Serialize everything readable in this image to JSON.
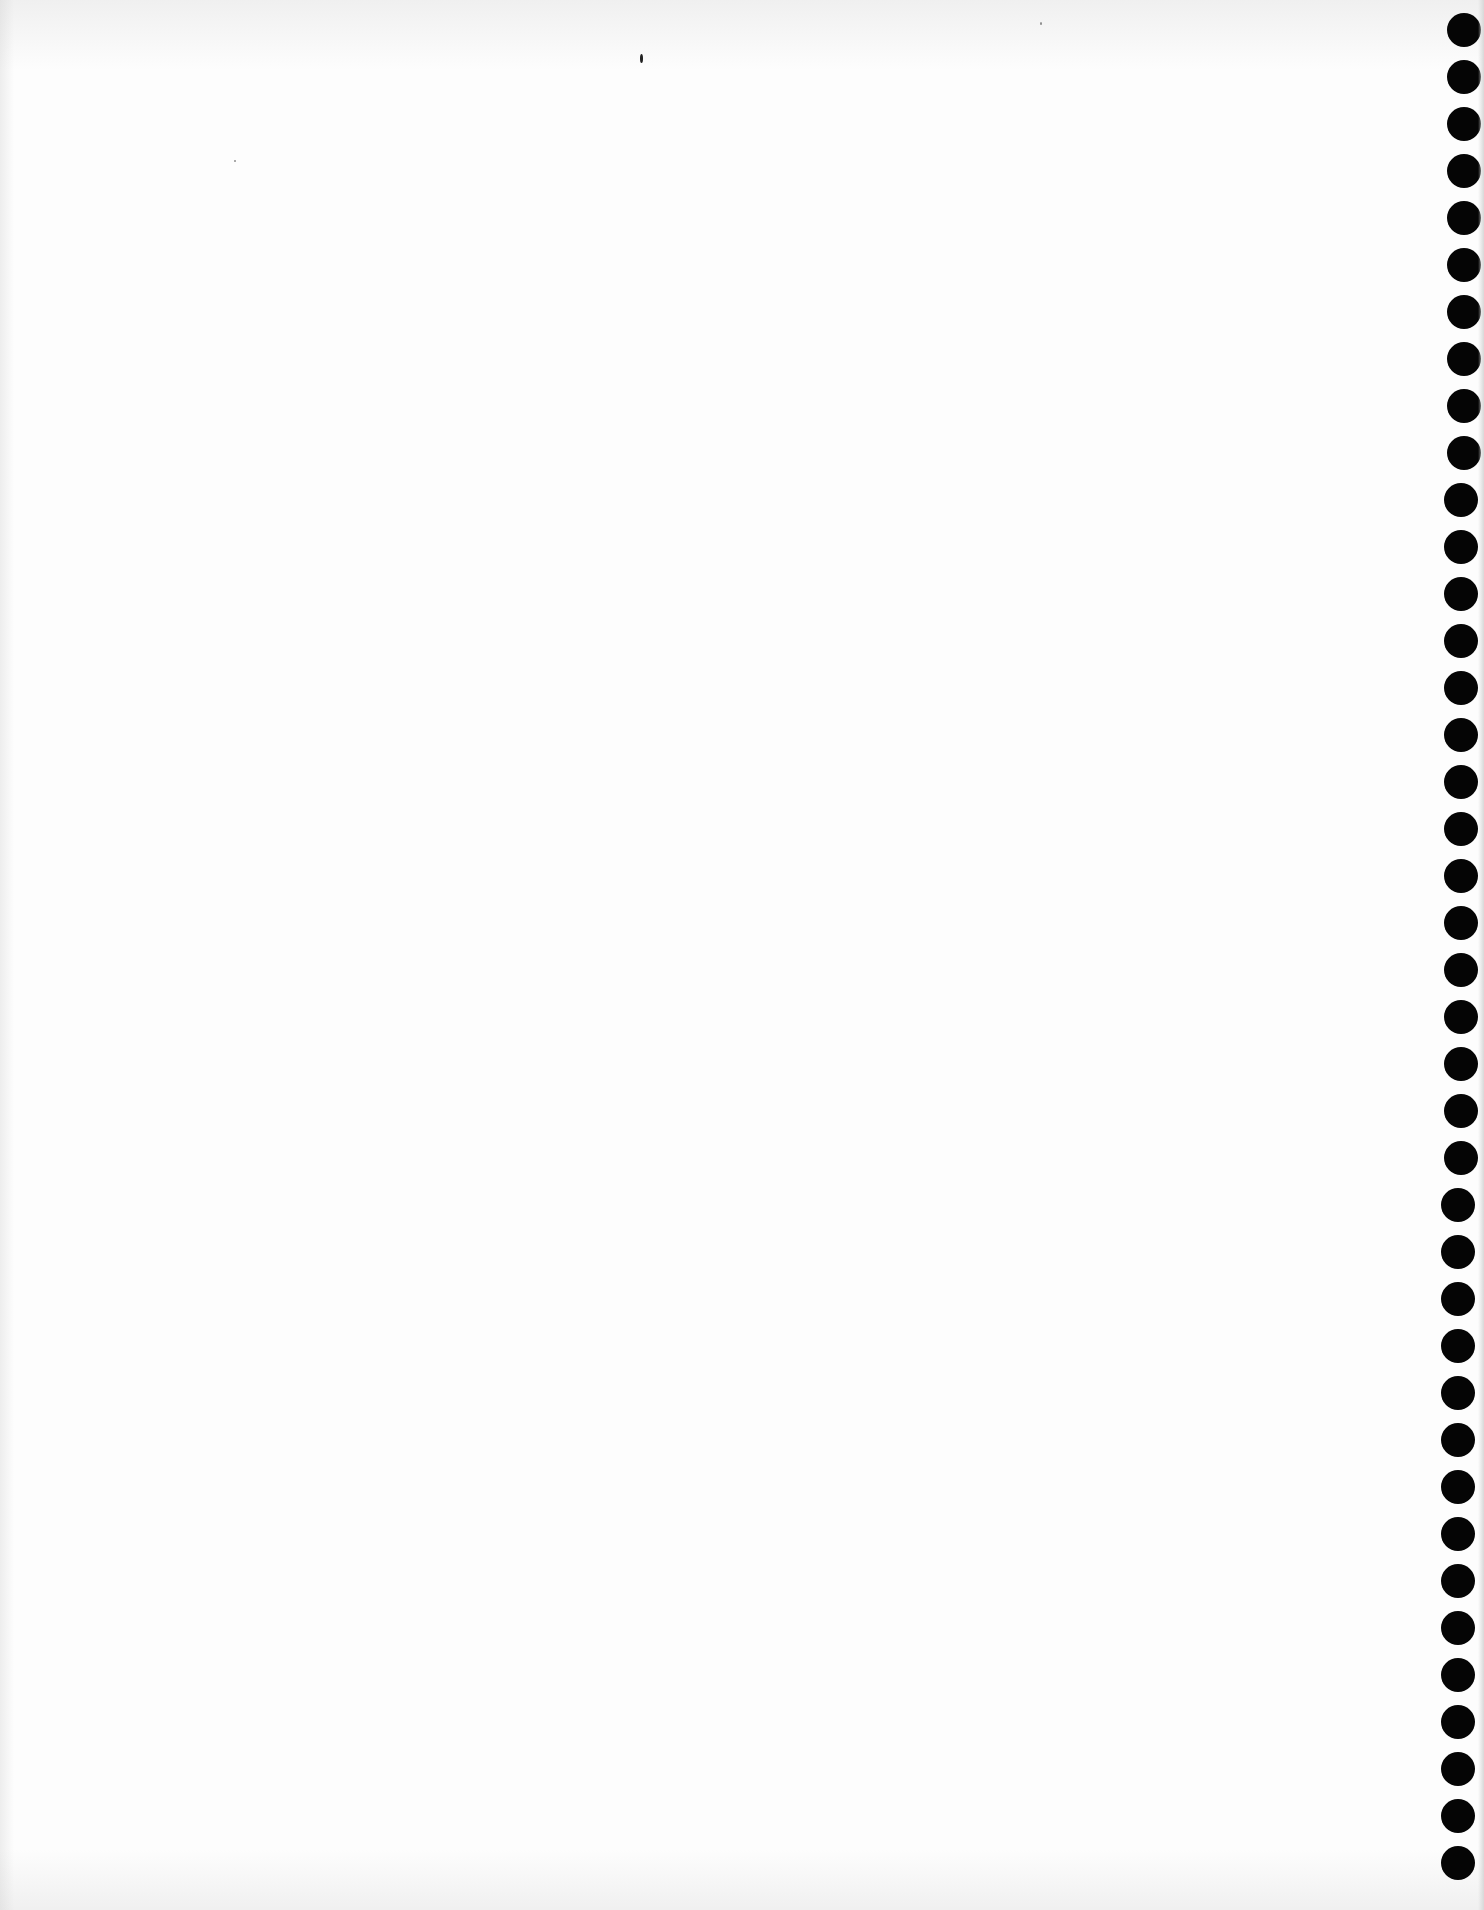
{
  "document": {
    "type": "blank scanned page",
    "text": "",
    "background_color": "#fdfdfd",
    "binding_holes": {
      "side": "right",
      "count": 40,
      "color": "#050505",
      "first_y": 30,
      "spacing": 47,
      "diameter": 34
    }
  }
}
